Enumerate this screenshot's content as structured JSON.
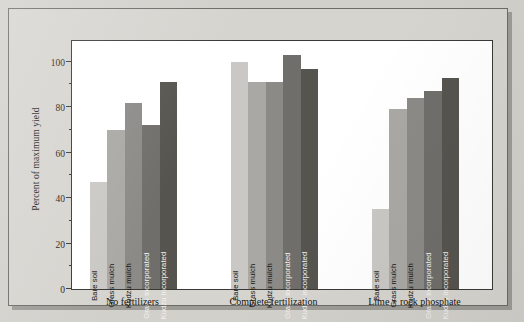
{
  "figure": {
    "panel_bg": "#d6d4cf",
    "plot_bg": "#ffffff",
    "axis_color": "#3a3936"
  },
  "axis": {
    "ylabel": "Percent of maximum yield",
    "yticks": [
      "0",
      "20",
      "40",
      "60",
      "80",
      "100"
    ]
  },
  "chart_data": {
    "type": "bar",
    "title": "",
    "subtitle": "",
    "xlabel": "",
    "ylabel": "Percent of maximum yield",
    "ylim": [
      0,
      110
    ],
    "ytick_values": [
      0,
      20,
      40,
      60,
      80,
      100
    ],
    "minor_tick_interval": 10,
    "grid": false,
    "legend": "none",
    "legend_position": "none",
    "categories": [
      "No fertilizers",
      "Complete fertilization",
      "Lime + rock phosphate"
    ],
    "series": [
      {
        "name": "Bare soil",
        "color": "#c9c8c4",
        "values": [
          47,
          100,
          35
        ]
      },
      {
        "name": "Grass mulch",
        "color": "#a9a8a4",
        "values": [
          70,
          91,
          79
        ]
      },
      {
        "name": "Kudzu mulch",
        "color": "#8b8a86",
        "values": [
          82,
          91,
          84
        ]
      },
      {
        "name": "Grass incorporated",
        "color": "#6f6e6a",
        "values": [
          72,
          103,
          87
        ]
      },
      {
        "name": "Kudzu incorporated",
        "color": "#55544f",
        "values": [
          91,
          97,
          93
        ]
      }
    ],
    "bar_labels_inside": true,
    "bar_label_rotation": -90,
    "annotations": []
  }
}
